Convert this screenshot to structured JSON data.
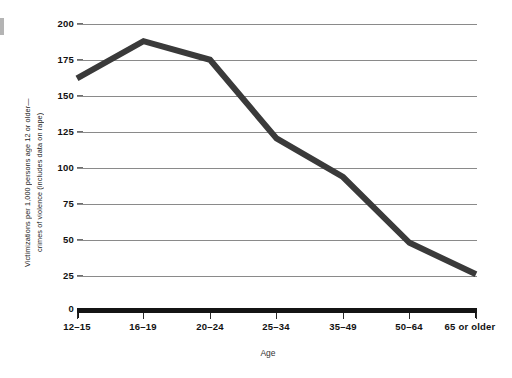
{
  "chart_data": {
    "type": "line",
    "title": "",
    "xlabel": "Age",
    "ylabel_line1": "Victimizations per 1,000 persons age 12 or older—",
    "ylabel_line2": "crimes of violence (includes data on rape)",
    "categories": [
      "12–15",
      "16–19",
      "20–24",
      "25–34",
      "35–49",
      "50–64",
      "65 or older"
    ],
    "values": [
      162,
      188,
      175,
      120,
      93,
      47,
      25
    ],
    "series": [
      {
        "name": "Violent crime victimization rate",
        "values": [
          162,
          188,
          175,
          120,
          93,
          47,
          25
        ]
      }
    ],
    "ylim": [
      0,
      200
    ],
    "yticks": [
      0,
      25,
      50,
      75,
      100,
      125,
      150,
      175,
      200
    ],
    "ytick_labels": [
      "0",
      "25",
      "50",
      "75",
      "100",
      "125",
      "150",
      "175",
      "200"
    ],
    "grid": true,
    "grid_axis": "y",
    "legend": false,
    "legend_position": "none",
    "line_color": "#3a3a3a",
    "line_width": 6,
    "grid_color": "#8a8a8a",
    "axis_color": "#141414",
    "background_color": "#ffffff"
  },
  "figure": {
    "edge_mark_color": "#b4b4b4"
  }
}
